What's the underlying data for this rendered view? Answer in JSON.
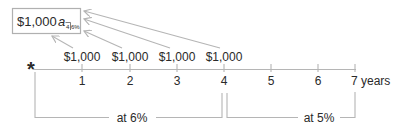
{
  "diagram": {
    "box": {
      "label": "$1,000",
      "symbol": "a",
      "subscript_n": "4",
      "subscript_rate": "6%"
    },
    "payments": [
      {
        "label": "$1,000",
        "year": 1
      },
      {
        "label": "$1,000",
        "year": 2
      },
      {
        "label": "$1,000",
        "year": 3
      },
      {
        "label": "$1,000",
        "year": 4
      }
    ],
    "timeline": {
      "origin_marker": "*",
      "ticks": [
        "1",
        "2",
        "3",
        "4",
        "5",
        "6",
        "7 years"
      ]
    },
    "periods": [
      {
        "label": "at 6%",
        "from_year": 0,
        "to_year": 4
      },
      {
        "label": "at 5%",
        "from_year": 4,
        "to_year": 7
      }
    ],
    "colors": {
      "line": "#b5b5b5",
      "text": "#2a2a2a",
      "box_border": "#b0b0b0"
    }
  }
}
